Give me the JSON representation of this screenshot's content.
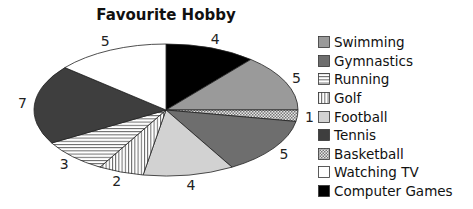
{
  "chart_data": {
    "type": "pie",
    "title": "Favourite Hobby",
    "categories": [
      "Swimming",
      "Gymnastics",
      "Running",
      "Golf",
      "Football",
      "Tennis",
      "Basketball",
      "Watching TV",
      "Computer Games"
    ],
    "values": [
      5,
      5,
      3,
      2,
      4,
      7,
      1,
      5,
      4
    ],
    "slice_order_clockwise_from_top": [
      "Computer Games",
      "Swimming",
      "Basketball",
      "Gymnastics",
      "Football",
      "Golf",
      "Running",
      "Tennis",
      "Watching TV"
    ],
    "data_labels": "values shown outside slices",
    "legend_position": "right",
    "style": "3D-tilted ellipse, greyscale with hatch patterns",
    "fills": {
      "Swimming": "#9a9a9a",
      "Gymnastics": "#6e6e6e",
      "Running": "horizontal-hatch",
      "Golf": "vertical-hatch",
      "Football": "#d2d2d2",
      "Tennis": "#3e3e3e",
      "Basketball": "checker",
      "Watching TV": "#ffffff",
      "Computer Games": "#000000"
    }
  },
  "title": "Favourite Hobby",
  "legend": [
    {
      "label": "Swimming",
      "fill": "#9a9a9a"
    },
    {
      "label": "Gymnastics",
      "fill": "#6e6e6e"
    },
    {
      "label": "Running",
      "fill": "url(#hatchH)"
    },
    {
      "label": "Golf",
      "fill": "url(#hatchV)"
    },
    {
      "label": "Football",
      "fill": "#d2d2d2"
    },
    {
      "label": "Tennis",
      "fill": "#3e3e3e"
    },
    {
      "label": "Basketball",
      "fill": "url(#checker)"
    },
    {
      "label": "Watching TV",
      "fill": "#ffffff"
    },
    {
      "label": "Computer Games",
      "fill": "#000000"
    }
  ]
}
